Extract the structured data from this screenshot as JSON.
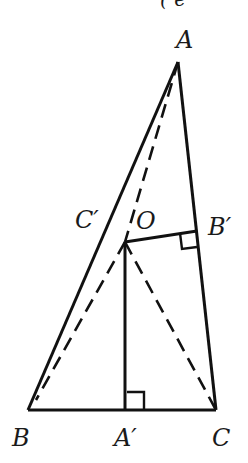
{
  "top_fragment": "( e",
  "figure": {
    "points": {
      "A": {
        "label": "A",
        "x": 178,
        "y": 62
      },
      "B": {
        "label": "B",
        "x": 28,
        "y": 410
      },
      "C": {
        "label": "C",
        "x": 216,
        "y": 410
      },
      "A_prime": {
        "label": "A′",
        "x": 125,
        "y": 410
      },
      "B_prime": {
        "label": "B′",
        "x": 196,
        "y": 231
      },
      "C_prime": {
        "label": "C′"
      },
      "O": {
        "label": "O",
        "x": 125,
        "y": 242
      }
    },
    "solid_segments": [
      "AB",
      "AC",
      "BC",
      "OA'",
      "OB'"
    ],
    "dashed_segments": [
      "AB-parallel through O (C' side)",
      "OA",
      "OC",
      "OB"
    ],
    "right_angles": [
      "A'",
      "B'"
    ]
  }
}
